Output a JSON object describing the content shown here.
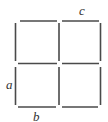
{
  "diagram": {
    "stroke_color": "#4a4a4a",
    "labels": [
      {
        "id": "a",
        "text": "a",
        "x": 6,
        "y": 89
      },
      {
        "id": "b",
        "text": "b",
        "x": 33,
        "y": 121
      },
      {
        "id": "c",
        "text": "c",
        "x": 79,
        "y": 15
      }
    ],
    "segments": [
      {
        "name": "top-left-horizontal",
        "x1": 20,
        "y1": 21,
        "x2": 57,
        "y2": 21
      },
      {
        "name": "top-right-horizontal",
        "x1": 62,
        "y1": 21,
        "x2": 99,
        "y2": 21
      },
      {
        "name": "middle-left-horizontal",
        "x1": 18,
        "y1": 63.5,
        "x2": 57,
        "y2": 63.5
      },
      {
        "name": "middle-right-horizontal",
        "x1": 62,
        "y1": 63.5,
        "x2": 99,
        "y2": 63.5
      },
      {
        "name": "bottom-left-horizontal",
        "x1": 18,
        "y1": 107,
        "x2": 56,
        "y2": 107
      },
      {
        "name": "bottom-right-horizontal",
        "x1": 62,
        "y1": 107,
        "x2": 98,
        "y2": 107
      },
      {
        "name": "left-upper-vertical",
        "x1": 15.5,
        "y1": 23,
        "x2": 15.5,
        "y2": 61
      },
      {
        "name": "left-lower-vertical",
        "x1": 15.5,
        "y1": 67,
        "x2": 15.5,
        "y2": 105
      },
      {
        "name": "middle-upper-vertical",
        "x1": 59,
        "y1": 23,
        "x2": 59,
        "y2": 61
      },
      {
        "name": "middle-lower-vertical",
        "x1": 59,
        "y1": 67,
        "x2": 59,
        "y2": 105
      },
      {
        "name": "right-upper-vertical",
        "x1": 100.5,
        "y1": 23,
        "x2": 100.5,
        "y2": 61
      },
      {
        "name": "right-lower-vertical",
        "x1": 100.5,
        "y1": 67,
        "x2": 100.5,
        "y2": 105
      }
    ]
  }
}
